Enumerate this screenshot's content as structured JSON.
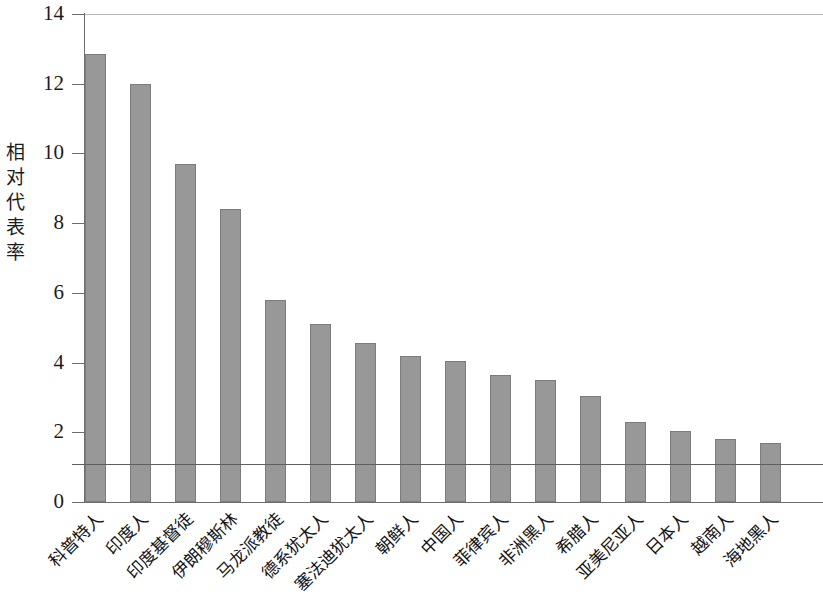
{
  "chart_data": {
    "type": "bar",
    "title": "",
    "xlabel": "",
    "ylabel": "相对代表率",
    "ylim": [
      0,
      14
    ],
    "yticks": [
      0,
      2,
      4,
      6,
      8,
      10,
      12,
      14
    ],
    "ytick_labels": [
      "0",
      "2",
      "4",
      "6",
      "8",
      "10",
      "12",
      "14"
    ],
    "grid": false,
    "legend": null,
    "reference_line": {
      "value": 1.1,
      "label": "",
      "orientation": "horizontal"
    },
    "bar_color": "#989898",
    "bar_edge_color": "#7c7c7c",
    "axis_color": "#6d6d6d",
    "categories": [
      "科普特人",
      "印度人",
      "印度基督徒",
      "伊朗穆斯林",
      "马龙派教徒",
      "德系犹太人",
      "塞法迪犹太人",
      "朝鲜人",
      "中国人",
      "菲律宾人",
      "非洲黑人",
      "希腊人",
      "亚美尼亚人",
      "日本人",
      "越南人",
      "海地黑人"
    ],
    "values": [
      12.85,
      12.0,
      9.7,
      8.4,
      5.8,
      5.1,
      4.55,
      4.2,
      4.05,
      3.65,
      3.5,
      3.05,
      2.3,
      2.05,
      1.8,
      1.7
    ]
  }
}
